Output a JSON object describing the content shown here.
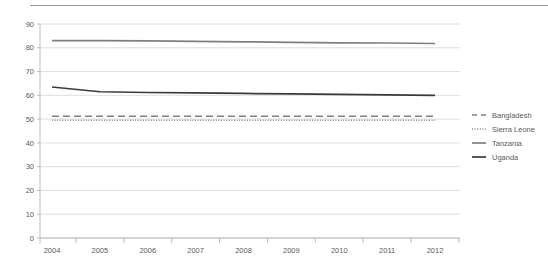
{
  "chart_data": {
    "type": "line",
    "title": "",
    "xlabel": "",
    "ylabel": "",
    "x": [
      2004,
      2005,
      2006,
      2007,
      2008,
      2009,
      2010,
      2011,
      2012
    ],
    "xtick_labels": [
      "2004",
      "2005",
      "2006",
      "2007",
      "2008",
      "2009",
      "2010",
      "2011",
      "2012"
    ],
    "ytick_labels": [
      "0",
      "10",
      "20",
      "30",
      "40",
      "50",
      "60",
      "70",
      "80",
      "90"
    ],
    "yticks": [
      0,
      10,
      20,
      30,
      40,
      50,
      60,
      70,
      80,
      90
    ],
    "ylim": [
      0,
      90
    ],
    "grid": true,
    "legend_position": "right",
    "series": [
      {
        "name": "Bangladesh",
        "style": "dashed",
        "color": "#808080",
        "values": [
          51.2,
          51.2,
          51.2,
          51.2,
          51.2,
          51.2,
          51.2,
          51.2,
          51.2
        ]
      },
      {
        "name": "Sierra Leone",
        "style": "dotted",
        "color": "#8c8c8c",
        "values": [
          49.5,
          49.5,
          49.5,
          49.5,
          49.5,
          49.5,
          49.5,
          49.5,
          49.5
        ]
      },
      {
        "name": "Tanzania",
        "style": "solid",
        "color": "#7f7f7f",
        "values": [
          83.0,
          83.0,
          82.9,
          82.7,
          82.5,
          82.3,
          82.1,
          82.0,
          81.8
        ]
      },
      {
        "name": "Uganda",
        "style": "solid",
        "color": "#3a3a3a",
        "values": [
          63.5,
          61.5,
          61.2,
          61.0,
          60.8,
          60.6,
          60.4,
          60.2,
          60.0
        ]
      }
    ]
  },
  "legend": {
    "entries": [
      {
        "label": "Bangladesh"
      },
      {
        "label": "Sierra Leone"
      },
      {
        "label": "Tanzania"
      },
      {
        "label": "Uganda"
      }
    ]
  }
}
